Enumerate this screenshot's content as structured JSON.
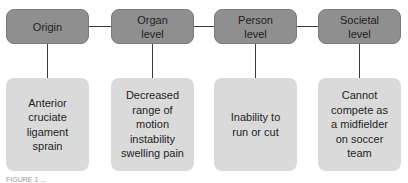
{
  "diagram": {
    "levels": [
      {
        "label": "Origin",
        "detail": "Anterior cruciate ligament sprain"
      },
      {
        "label": "Organ level",
        "detail": "Decreased range of motion instability swelling pain"
      },
      {
        "label": "Person level",
        "detail": "Inability to run or cut"
      },
      {
        "label": "Societal level",
        "detail": "Cannot compete as a midfielder on soccer team"
      }
    ],
    "caption": "FIGURE 1 ..."
  }
}
